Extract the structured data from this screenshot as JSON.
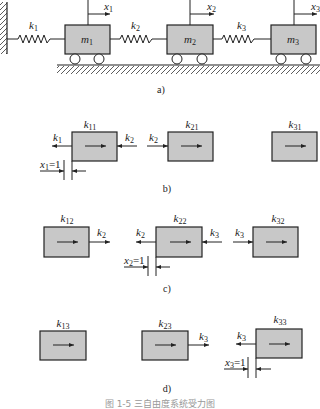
{
  "colors": {
    "block_fill": "#c8c8c8",
    "stroke": "#222222"
  },
  "panel_a": {
    "caption": "a)",
    "masses": [
      {
        "label": "m",
        "sub": "1",
        "disp": "x",
        "disp_sub": "1"
      },
      {
        "label": "m",
        "sub": "2",
        "disp": "x",
        "disp_sub": "2"
      },
      {
        "label": "m",
        "sub": "3",
        "disp": "x",
        "disp_sub": "3"
      }
    ],
    "springs": [
      {
        "label": "k",
        "sub": "1"
      },
      {
        "label": "k",
        "sub": "2"
      },
      {
        "label": "k",
        "sub": "3"
      }
    ]
  },
  "panel_b": {
    "caption": "b)",
    "blocks": [
      {
        "label": "k",
        "sub": "11"
      },
      {
        "label": "k",
        "sub": "21"
      },
      {
        "label": "k",
        "sub": "31"
      }
    ],
    "forces": [
      {
        "label": "k",
        "sub": "1"
      },
      {
        "label": "k",
        "sub": "2"
      },
      {
        "label": "k",
        "sub": "2"
      }
    ],
    "unit_disp": {
      "label": "x",
      "sub": "1",
      "eq": "=1"
    }
  },
  "panel_c": {
    "caption": "c)",
    "blocks": [
      {
        "label": "k",
        "sub": "12"
      },
      {
        "label": "k",
        "sub": "22"
      },
      {
        "label": "k",
        "sub": "32"
      }
    ],
    "forces": [
      {
        "label": "k",
        "sub": "2"
      },
      {
        "label": "k",
        "sub": "2"
      },
      {
        "label": "k",
        "sub": "3"
      },
      {
        "label": "k",
        "sub": "3"
      }
    ],
    "unit_disp": {
      "label": "x",
      "sub": "2",
      "eq": "=1"
    }
  },
  "panel_d": {
    "caption": "d)",
    "blocks": [
      {
        "label": "k",
        "sub": "13"
      },
      {
        "label": "k",
        "sub": "23"
      },
      {
        "label": "k",
        "sub": "33"
      }
    ],
    "forces": [
      {
        "label": "k",
        "sub": "3"
      },
      {
        "label": "k",
        "sub": "3"
      }
    ],
    "unit_disp": {
      "label": "x",
      "sub": "3",
      "eq": "=1"
    }
  },
  "figure_caption": "图 1-5  三自由度系统受力图"
}
